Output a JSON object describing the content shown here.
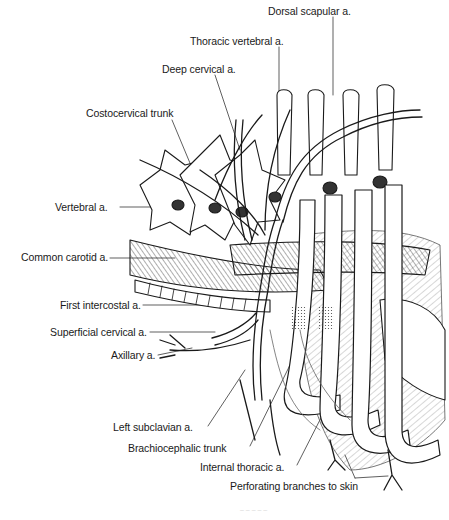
{
  "figure": {
    "type": "anatomical line drawing",
    "labels": [
      {
        "id": "dorsal-scapular",
        "text": "Dorsal scapular a.",
        "x": 268,
        "y": 5
      },
      {
        "id": "thoracic-vertebral",
        "text": "Thoracic vertebral a.",
        "x": 190,
        "y": 35
      },
      {
        "id": "deep-cervical",
        "text": "Deep cervical a.",
        "x": 162,
        "y": 63
      },
      {
        "id": "costocervical-trunk",
        "text": "Costocervical trunk",
        "x": 86,
        "y": 107
      },
      {
        "id": "vertebral",
        "text": "Vertebral a.",
        "x": 55,
        "y": 201
      },
      {
        "id": "common-carotid",
        "text": "Common carotid a.",
        "x": 21,
        "y": 251
      },
      {
        "id": "first-intercostal",
        "text": "First intercostal a.",
        "x": 60,
        "y": 299
      },
      {
        "id": "superficial-cervical",
        "text": "Superficial cervical a.",
        "x": 50,
        "y": 326
      },
      {
        "id": "axillary",
        "text": "Axillary a.",
        "x": 111,
        "y": 349
      },
      {
        "id": "left-subclavian",
        "text": "Left subclavian a.",
        "x": 113,
        "y": 421
      },
      {
        "id": "brachiocephalic-trunk",
        "text": "Brachiocephalic trunk",
        "x": 128,
        "y": 442
      },
      {
        "id": "internal-thoracic",
        "text": "Internal thoracic a.",
        "x": 200,
        "y": 461
      },
      {
        "id": "perforating-branches",
        "text": "Perforating branches to skin",
        "x": 230,
        "y": 480
      }
    ],
    "caption": "– – – – –"
  },
  "colors": {
    "ink": "#1a1a1a",
    "background": "#ffffff",
    "shading": "#555555"
  }
}
